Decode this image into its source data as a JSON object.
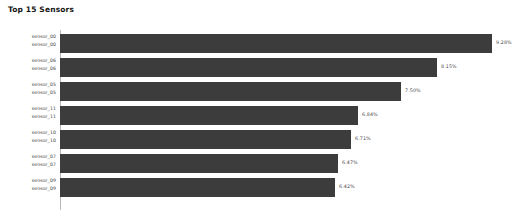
{
  "chart": {
    "title": "Top 15 Sensors"
  },
  "chart_data": {
    "type": "bar",
    "orientation": "horizontal",
    "title": "Top 15 Sensors",
    "xlabel": "",
    "ylabel": "",
    "grid": false,
    "legend": false,
    "xlim": [
      0,
      10
    ],
    "value_unit": "%",
    "note": "Only the top 7 of 15 categories are visible in this cropped view; each category tick label is rendered twice.",
    "categories": [
      "sensor_00",
      "sensor_06",
      "sensor_05",
      "sensor_11",
      "sensor_10",
      "sensor_07",
      "sensor_09"
    ],
    "values": [
      9.28,
      8.15,
      7.5,
      6.84,
      6.71,
      6.47,
      6.42
    ],
    "value_labels": [
      "9.28%",
      "8.15%",
      "7.50%",
      "6.84%",
      "6.71%",
      "6.47%",
      "6.42%"
    ],
    "bar_color": "#3c3c3c",
    "background_color": "#ffffff",
    "rows": [
      {
        "category": "sensor_00",
        "tick_label_top": "sensor_00",
        "tick_label_bottom": "sensor_00",
        "value": 9.28,
        "value_label": "9.28%",
        "bar_width_px": 432
      },
      {
        "category": "sensor_06",
        "tick_label_top": "sensor_06",
        "tick_label_bottom": "sensor_06",
        "value": 8.15,
        "value_label": "8.15%",
        "bar_width_px": 377
      },
      {
        "category": "sensor_05",
        "tick_label_top": "sensor_05",
        "tick_label_bottom": "sensor_05",
        "value": 7.5,
        "value_label": "7.50%",
        "bar_width_px": 341
      },
      {
        "category": "sensor_11",
        "tick_label_top": "sensor_11",
        "tick_label_bottom": "sensor_11",
        "value": 6.84,
        "value_label": "6.84%",
        "bar_width_px": 298
      },
      {
        "category": "sensor_10",
        "tick_label_top": "sensor_10",
        "tick_label_bottom": "sensor_10",
        "value": 6.71,
        "value_label": "6.71%",
        "bar_width_px": 291
      },
      {
        "category": "sensor_07",
        "tick_label_top": "sensor_07",
        "tick_label_bottom": "sensor_07",
        "value": 6.47,
        "value_label": "6.47%",
        "bar_width_px": 278
      },
      {
        "category": "sensor_09",
        "tick_label_top": "sensor_09",
        "tick_label_bottom": "sensor_09",
        "value": 6.42,
        "value_label": "6.42%",
        "bar_width_px": 275
      }
    ]
  }
}
